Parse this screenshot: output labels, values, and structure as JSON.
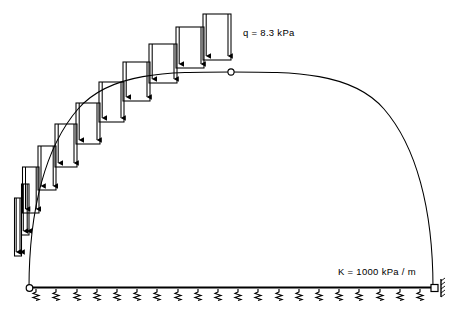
{
  "diagram": {
    "type": "structural-engineering-schematic",
    "colors": {
      "line": "#000000",
      "background": "#ffffff"
    },
    "labels": {
      "load_label": "q = 8.3 kPa",
      "stiffness_label": "K = 1000 kPa / m"
    },
    "annotations": {
      "load_value": "8.3",
      "load_unit": "kPa",
      "load_symbol": "q",
      "stiffness_value": "1000",
      "stiffness_unit": "kPa / m",
      "stiffness_symbol": "K"
    },
    "geometry": {
      "arch": {
        "left_springing_x": 29,
        "right_springing_x": 433,
        "base_y": 288,
        "crown_x": 231,
        "crown_y": 72,
        "span": 404,
        "rise": 216
      },
      "base_beam": {
        "x1": 29,
        "x2": 437,
        "y": 287
      }
    },
    "supports": {
      "left": {
        "name": "pin-support",
        "shape": "circle-hinge",
        "x": 29,
        "y": 288
      },
      "right": {
        "name": "roller-support",
        "shape": "roller-with-hatch",
        "x": 436,
        "y": 288
      },
      "crown": {
        "name": "crown-hinge",
        "shape": "circle-hinge",
        "x": 231,
        "y": 72
      }
    },
    "springs": {
      "count": 20,
      "symbol": "zigzag-spring",
      "start_x": 36,
      "spacing": 20.2,
      "top_y": 289,
      "bottom_y": 300
    },
    "load_blocks": [
      {
        "index": 1,
        "x_left": 14,
        "x_right": 21,
        "top_y": 198,
        "bottom_y": 256,
        "arrows": 2
      },
      {
        "index": 2,
        "x_left": 21,
        "x_right": 28,
        "top_y": 185,
        "bottom_y": 235,
        "arrows": 2
      },
      {
        "index": 3,
        "x_left": 23,
        "x_right": 39,
        "top_y": 168,
        "bottom_y": 213,
        "arrows": 2
      },
      {
        "index": 4,
        "x_left": 38,
        "x_right": 56,
        "top_y": 146,
        "bottom_y": 190,
        "arrows": 2
      },
      {
        "index": 5,
        "x_left": 55,
        "x_right": 77,
        "top_y": 124,
        "bottom_y": 167,
        "arrows": 2
      },
      {
        "index": 6,
        "x_left": 76,
        "x_right": 100,
        "top_y": 103,
        "bottom_y": 144,
        "arrows": 2
      },
      {
        "index": 7,
        "x_left": 99,
        "x_right": 124,
        "top_y": 82,
        "bottom_y": 122,
        "arrows": 2
      },
      {
        "index": 8,
        "x_left": 123,
        "x_right": 150,
        "top_y": 62,
        "bottom_y": 101,
        "arrows": 2
      },
      {
        "index": 9,
        "x_left": 149,
        "x_right": 177,
        "top_y": 44,
        "bottom_y": 83,
        "arrows": 2
      },
      {
        "index": 10,
        "x_left": 176,
        "x_right": 204,
        "top_y": 27,
        "bottom_y": 68,
        "arrows": 2
      },
      {
        "index": 11,
        "x_left": 203,
        "x_right": 231,
        "top_y": 14,
        "bottom_y": 60,
        "arrows": 2
      }
    ]
  }
}
